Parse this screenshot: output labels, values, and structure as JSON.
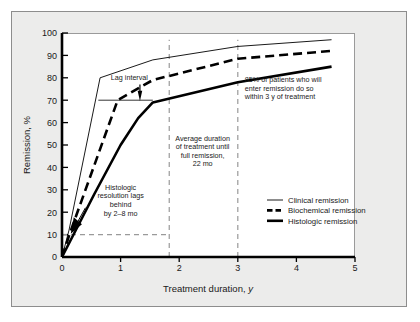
{
  "figure": {
    "background_color": "#ececeb",
    "plot_background_color": "#ffffff",
    "border_color": "#8d8d8d",
    "line_color": "#000000",
    "dashed_guide_color": "#9a9a9a"
  },
  "chart_data": {
    "type": "line",
    "title": "",
    "xlabel": "Treatment duration, y",
    "ylabel": "Remission, %",
    "xlim": [
      0,
      5
    ],
    "ylim": [
      0,
      100
    ],
    "xticks": [
      "0",
      "1",
      "2",
      "3",
      "4",
      "5"
    ],
    "yticks": [
      "0",
      "10",
      "20",
      "30",
      "40",
      "50",
      "60",
      "70",
      "80",
      "90",
      "100"
    ],
    "grid": false,
    "legend_position": "bottom-right",
    "series": [
      {
        "name": "Clinical remission",
        "style": "thin-solid",
        "points": [
          [
            0.0,
            0.0
          ],
          [
            0.12,
            12.0
          ],
          [
            0.65,
            80.0
          ],
          [
            1.55,
            88.0
          ],
          [
            3.0,
            94.0
          ],
          [
            4.6,
            97.0
          ]
        ]
      },
      {
        "name": "Biochemical remission",
        "style": "dashed",
        "points": [
          [
            0.0,
            0.0
          ],
          [
            0.14,
            11.0
          ],
          [
            0.95,
            70.0
          ],
          [
            1.55,
            79.0
          ],
          [
            3.0,
            88.5
          ],
          [
            4.6,
            92.0
          ]
        ]
      },
      {
        "name": "Histologic remission",
        "style": "thick-solid",
        "points": [
          [
            0.0,
            0.0
          ],
          [
            0.55,
            28.0
          ],
          [
            1.0,
            50.0
          ],
          [
            1.3,
            62.0
          ],
          [
            1.55,
            69.0
          ],
          [
            3.0,
            78.0
          ],
          [
            4.6,
            85.0
          ]
        ]
      }
    ],
    "reference_lines": [
      {
        "name": "average-duration-line",
        "orientation": "vertical",
        "x": 1.83,
        "style": "dashed"
      },
      {
        "name": "three-year-line",
        "orientation": "vertical",
        "x": 3.0,
        "style": "dashed"
      },
      {
        "name": "ten-percent-line",
        "orientation": "horizontal",
        "y": 10.0,
        "x_from": 0.0,
        "x_to": 1.83,
        "style": "dashed"
      },
      {
        "name": "lag-interval-line",
        "orientation": "horizontal",
        "y": 70.0,
        "x_from": 0.62,
        "x_to": 1.55,
        "style": "thin-solid"
      }
    ],
    "annotations": [
      {
        "name": "lag-interval",
        "lines": [
          "Lag interval"
        ],
        "x": 1.15,
        "y": 79
      },
      {
        "name": "histologic-lag-note",
        "lines": [
          "Histologic",
          "resolution lags",
          "behind",
          "by 2–8 mo"
        ],
        "x": 1.0,
        "y": 30
      },
      {
        "name": "average-duration-note",
        "lines": [
          "Average duration",
          "of treatment until",
          "full remission,",
          "22 mo"
        ],
        "x": 2.4,
        "y": 52
      },
      {
        "name": "eighty-five-percent-note",
        "lines": [
          "85% of patients who will",
          "enter remission do so",
          "within 3 y of treatment"
        ],
        "x": 3.12,
        "y": 78
      }
    ],
    "legend": [
      {
        "label": "Clinical remission",
        "style": "thin-solid"
      },
      {
        "label": "Biochemical remission",
        "style": "dashed"
      },
      {
        "label": "Histologic remission",
        "style": "thick-solid"
      }
    ]
  }
}
